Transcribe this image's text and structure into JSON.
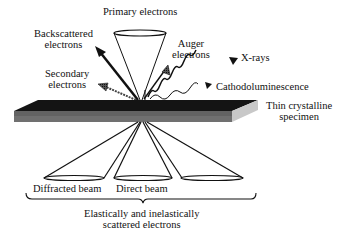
{
  "diagram": {
    "type": "electron-specimen-interaction",
    "labels": {
      "primary_electrons": "Primary electrons",
      "backscattered_line1": "Backscattered",
      "backscattered_line2": "electrons",
      "secondary_line1": "Secondary",
      "secondary_line2": "electrons",
      "auger_line1": "Auger",
      "auger_line2": "electrons",
      "xrays": "X-rays",
      "cathodoluminescence": "Cathodoluminescence",
      "specimen_line1": "Thin crystalline",
      "specimen_line2": "specimen",
      "diffracted_beam": "Diffracted beam",
      "direct_beam": "Direct beam",
      "scattered_line1": "Elastically and inelastically",
      "scattered_line2": "scattered electrons"
    },
    "colors": {
      "ink": "#111111",
      "specimen_top": "#141414",
      "specimen_front": "#6a6a6a",
      "specimen_side": "#c8c8c8",
      "background": "#ffffff"
    }
  }
}
